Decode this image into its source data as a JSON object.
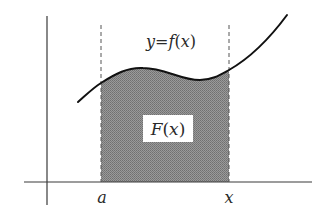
{
  "diagram": {
    "curve_label": {
      "y": "y",
      "eq": "=",
      "f": "f",
      "open": "(",
      "x": "x",
      "close": ")"
    },
    "area_label": {
      "F": "F",
      "open": "(",
      "x": "x",
      "close": ")"
    },
    "x_axis_labels": {
      "lower_bound": "a",
      "upper_bound": "x"
    },
    "colors": {
      "axis": "#3a3a3a",
      "curve": "#111111",
      "fill": "#8c8c8c",
      "dashed": "#555555",
      "label_box": "#ffffff"
    }
  }
}
